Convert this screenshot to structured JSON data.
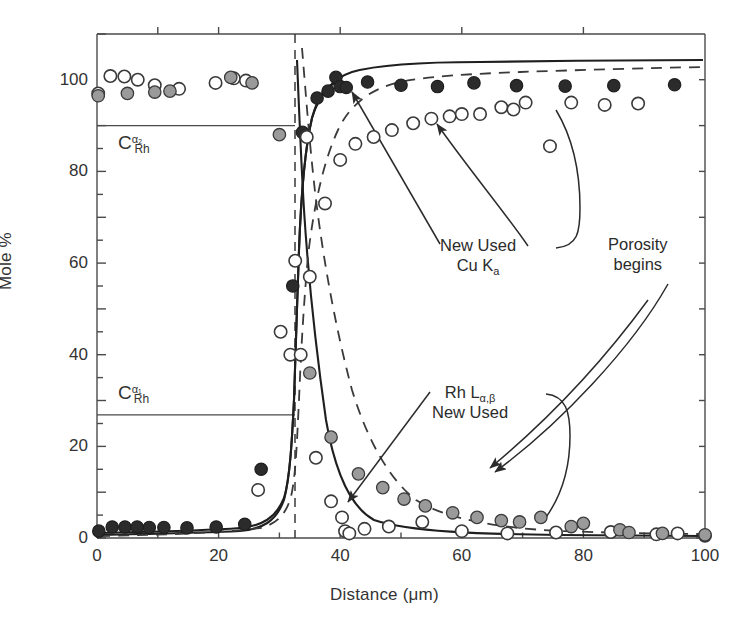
{
  "chart_data": {
    "type": "scatter",
    "title": "",
    "xlabel": "Distance (μm)",
    "ylabel": "Mole %",
    "xlim": [
      0,
      100
    ],
    "ylim": [
      0,
      110
    ],
    "x_ticks": [
      0,
      20,
      40,
      60,
      80,
      100
    ],
    "x_tick_labels": [
      "0",
      "20",
      "40",
      "60",
      "80",
      "100"
    ],
    "x_minor_ticks": [
      10,
      30,
      50,
      70,
      90
    ],
    "y_ticks": [
      0,
      20,
      40,
      60,
      80,
      100
    ],
    "y_tick_labels": [
      "0",
      "20",
      "40",
      "60",
      "80",
      "100"
    ],
    "y_minor_ticks": [
      10,
      30,
      50,
      70,
      90
    ],
    "grid": false,
    "legend_position": "none",
    "series": [
      {
        "name": "Cu Kα New",
        "marker": "filled-dark-circle",
        "line": "solid",
        "points": [
          [
            0.3,
            1.5
          ],
          [
            2.5,
            2.4
          ],
          [
            4.6,
            2.4
          ],
          [
            6.6,
            2.4
          ],
          [
            8.6,
            2.3
          ],
          [
            11.0,
            2.3
          ],
          [
            14.8,
            2.2
          ],
          [
            19.6,
            2.4
          ],
          [
            24.3,
            3.0
          ],
          [
            27.0,
            15.0
          ],
          [
            32.2,
            55.0
          ],
          [
            33.8,
            88.5
          ],
          [
            36.2,
            96.0
          ],
          [
            38.0,
            97.5
          ],
          [
            39.3,
            100.5
          ],
          [
            40.0,
            98.5
          ],
          [
            41.0,
            98.3
          ],
          [
            44.5,
            99.5
          ],
          [
            50.0,
            98.8
          ],
          [
            56.0,
            98.5
          ],
          [
            62.0,
            99.3
          ],
          [
            69.0,
            98.7
          ],
          [
            77.0,
            98.6
          ],
          [
            85.0,
            98.7
          ],
          [
            95.0,
            98.9
          ]
        ]
      },
      {
        "name": "Rh Lα,β New",
        "marker": "open-circle",
        "line": "solid",
        "points": [
          [
            0.2,
            97.0
          ],
          [
            2.2,
            100.8
          ],
          [
            4.5,
            100.7
          ],
          [
            6.7,
            100.0
          ],
          [
            9.5,
            98.8
          ],
          [
            13.5,
            98.0
          ],
          [
            19.5,
            99.3
          ],
          [
            22.5,
            100.3
          ],
          [
            24.5,
            99.8
          ],
          [
            26.5,
            10.5
          ],
          [
            30.2,
            45.0
          ],
          [
            31.8,
            40.0
          ],
          [
            32.6,
            60.5
          ],
          [
            34.5,
            87.5
          ],
          [
            36.0,
            17.5
          ],
          [
            38.5,
            8.0
          ],
          [
            40.3,
            4.5
          ],
          [
            40.8,
            1.5
          ],
          [
            41.5,
            1.0
          ],
          [
            44.0,
            2.0
          ],
          [
            48.0,
            2.5
          ],
          [
            53.5,
            3.5
          ],
          [
            60.0,
            1.5
          ],
          [
            67.5,
            1.0
          ],
          [
            75.5,
            1.2
          ],
          [
            84.5,
            1.3
          ],
          [
            92.0,
            0.8
          ],
          [
            95.5,
            1.0
          ],
          [
            100.0,
            0.5
          ]
        ]
      },
      {
        "name": "Cu Kα Used",
        "marker": "gray-circle",
        "line": "dashed",
        "points": [
          [
            0.2,
            96.5
          ],
          [
            5.0,
            97.0
          ],
          [
            9.5,
            97.3
          ],
          [
            12.0,
            97.5
          ],
          [
            22.0,
            100.5
          ],
          [
            25.5,
            99.3
          ],
          [
            30.0,
            88.0
          ],
          [
            35.0,
            36.0
          ],
          [
            38.5,
            22.0
          ],
          [
            43.0,
            14.0
          ],
          [
            47.0,
            11.0
          ],
          [
            50.5,
            8.5
          ],
          [
            54.0,
            7.0
          ],
          [
            58.5,
            5.5
          ],
          [
            62.5,
            4.5
          ],
          [
            66.5,
            3.8
          ],
          [
            69.5,
            3.5
          ],
          [
            73.0,
            4.5
          ],
          [
            78.0,
            2.5
          ],
          [
            80.0,
            3.2
          ],
          [
            86.0,
            1.8
          ],
          [
            87.5,
            1.2
          ],
          [
            93.0,
            1.0
          ],
          [
            100.0,
            0.7
          ]
        ]
      },
      {
        "name": "Rh Lα,β Used",
        "marker": "open-circle",
        "line": "dashed",
        "points": [
          [
            33.5,
            40.0
          ],
          [
            35.0,
            57.0
          ],
          [
            37.5,
            73.0
          ],
          [
            40.0,
            82.5
          ],
          [
            42.5,
            86.0
          ],
          [
            45.5,
            87.5
          ],
          [
            48.5,
            89.0
          ],
          [
            52.0,
            90.5
          ],
          [
            55.0,
            91.5
          ],
          [
            58.0,
            92.0
          ],
          [
            60.0,
            92.5
          ],
          [
            63.0,
            92.5
          ],
          [
            66.5,
            94.0
          ],
          [
            68.5,
            93.5
          ],
          [
            70.5,
            95.0
          ],
          [
            74.5,
            85.5
          ],
          [
            78.0,
            95.0
          ],
          [
            83.5,
            94.5
          ],
          [
            89.0,
            94.8
          ]
        ]
      }
    ],
    "reference_lines": [
      {
        "name": "C_Rh_alpha2",
        "type": "horizontal",
        "y": 90,
        "x_from": 0,
        "x_to": 32.6,
        "style": "solid"
      },
      {
        "name": "C_Rh_alpha1",
        "type": "horizontal",
        "y": 25,
        "x_from": 0,
        "x_to": 32.6,
        "style": "solid"
      },
      {
        "name": "interface",
        "type": "vertical",
        "x": 32.6,
        "y_from": 0,
        "y_to": 110,
        "style": "dashed"
      }
    ],
    "annotations": [
      {
        "name": "cu-k-alpha",
        "lines": [
          "New Used",
          "Cu Kₐ"
        ],
        "x_pct": 64,
        "y_pct": 41,
        "points_to": [
          39.0,
          100.0
        ]
      },
      {
        "name": "rh-l-alpha-beta",
        "lines": [
          "Rh Lα,β",
          "New Used"
        ],
        "x_pct": 63,
        "y_pct": 63,
        "points_to": [
          40.5,
          5.0
        ]
      },
      {
        "name": "porosity-begins",
        "lines": [
          "Porosity",
          "begins"
        ],
        "x_pct": 91,
        "y_pct": 41,
        "points_to": [
          77.0,
          7.0
        ]
      }
    ],
    "concentration_labels": [
      {
        "name": "c-rh-alpha2",
        "base": "C",
        "sup": "α₂",
        "sub": "Rh",
        "y": 90
      },
      {
        "name": "c-rh-alpha1",
        "base": "C",
        "sup": "α₁",
        "sub": "Rh",
        "y": 25
      }
    ],
    "colors": {
      "axis": "#4a4a4a",
      "curve": "#1f1f1f",
      "marker_dark": "#2b2b2b",
      "marker_gray": "#9a9a9a",
      "marker_open": "#ffffff",
      "text": "#2b2b2b"
    }
  }
}
